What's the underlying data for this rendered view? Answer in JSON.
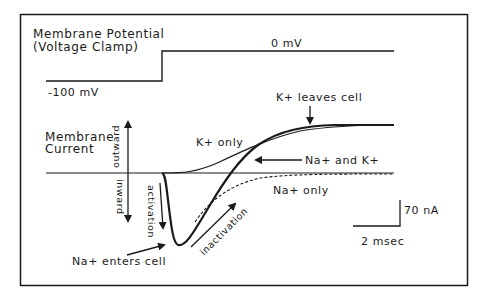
{
  "diagram": {
    "title_line1": "Membrane Potential",
    "title_line2": "(Voltage Clamp)",
    "voltage_hold_label": "-100 mV",
    "voltage_step_label": "0 mV",
    "current_label_line1": "Membrane",
    "current_label_line2": "Current",
    "outward_label": "outward",
    "inward_label": "inward",
    "activation_label": "activation",
    "inactivation_label": "inactivation",
    "k_leaves_label": "K+ leaves cell",
    "k_only_label": "K+ only",
    "na_and_k_label": "Na+ and K+",
    "na_only_label": "Na+ only",
    "na_enters_label": "Na+ enters cell",
    "scale_current_label": "70 nA",
    "scale_time_label": "2 msec"
  },
  "colors": {
    "ink": "#1a1a1a",
    "background": "#ffffff"
  }
}
